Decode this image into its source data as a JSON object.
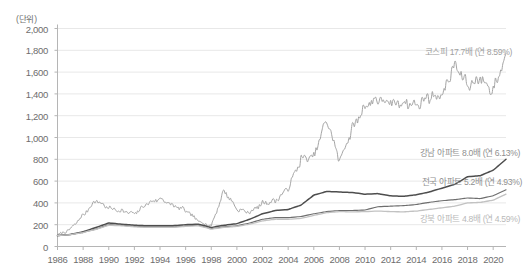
{
  "unit_label": "(단위)",
  "axis": {
    "y_ticks": [
      "2,000",
      "1,800",
      "1,600",
      "1,400",
      "1,200",
      "1,000",
      "800",
      "600",
      "400",
      "200",
      "0"
    ],
    "x_ticks": [
      "1986",
      "1988",
      "1990",
      "1992",
      "1994",
      "1996",
      "1998",
      "2000",
      "2002",
      "2004",
      "2006",
      "2008",
      "2010",
      "2012",
      "2014",
      "2016",
      "2018",
      "2020"
    ]
  },
  "annotations": {
    "kospi": "코스피 17.7배 (연 8.59%)",
    "gangnam": "강남 아파트 8.0배 (연 6.13%)",
    "nationwide": "전국 아파트 5.2배 (연 4.93%)",
    "gangbuk": "강북 아파트 4.8배 (연 4.59%)"
  },
  "colors": {
    "kospi_line": "#9a9a9a",
    "gangnam_line": "#4d4d4d",
    "nationwide_line": "#6e6e6e",
    "gangbuk_line": "#c2c2c2",
    "grid": "#e8e8e8",
    "axis": "#b5b5b5",
    "tick_text": "#6d6d6d",
    "note_text_kospi": "#a0a0a0",
    "note_text_gangnam": "#8f8f8f",
    "note_text_nationwide": "#8f8f8f",
    "note_text_gangbuk": "#b9b9b9"
  },
  "chart_data": {
    "type": "line",
    "title": "",
    "subtitle": "",
    "xlabel": "",
    "ylabel": "(단위)",
    "xlim": [
      1986,
      2021
    ],
    "ylim": [
      0,
      2000
    ],
    "grid": true,
    "legend_position": "inline-right-annotations",
    "x": [
      1986,
      1987,
      1988,
      1989,
      1990,
      1991,
      1992,
      1993,
      1994,
      1995,
      1996,
      1997,
      1998,
      1999,
      2000,
      2001,
      2002,
      2003,
      2004,
      2005,
      2006,
      2007,
      2008,
      2009,
      2010,
      2011,
      2012,
      2013,
      2014,
      2015,
      2016,
      2017,
      2018,
      2019,
      2020,
      2021
    ],
    "series": [
      {
        "name": "코스피",
        "label": "코스피 17.7배 (연 8.59%)",
        "multiple": 17.7,
        "annual_return_pct": 8.59,
        "color": "#9a9a9a",
        "values": [
          100,
          160,
          290,
          420,
          350,
          330,
          300,
          390,
          440,
          380,
          330,
          230,
          190,
          520,
          340,
          310,
          400,
          420,
          530,
          800,
          830,
          1170,
          780,
          1080,
          1300,
          1350,
          1300,
          1330,
          1300,
          1370,
          1380,
          1680,
          1480,
          1530,
          1430,
          1770
        ]
      },
      {
        "name": "강남 아파트",
        "label": "강남 아파트 8.0배 (연 6.13%)",
        "multiple": 8.0,
        "annual_return_pct": 6.13,
        "color": "#4d4d4d",
        "values": [
          100,
          110,
          135,
          175,
          215,
          205,
          195,
          190,
          190,
          190,
          200,
          205,
          175,
          195,
          210,
          250,
          300,
          330,
          340,
          380,
          470,
          505,
          500,
          495,
          480,
          485,
          465,
          460,
          475,
          500,
          535,
          570,
          640,
          650,
          700,
          800
        ]
      },
      {
        "name": "전국 아파트",
        "label": "전국 아파트 5.2배 (연 4.93%)",
        "multiple": 5.2,
        "annual_return_pct": 4.93,
        "color": "#6e6e6e",
        "values": [
          100,
          110,
          130,
          160,
          200,
          195,
          185,
          180,
          180,
          180,
          190,
          195,
          165,
          180,
          190,
          215,
          250,
          265,
          265,
          275,
          300,
          320,
          330,
          330,
          335,
          365,
          370,
          375,
          385,
          405,
          420,
          430,
          445,
          440,
          465,
          520
        ]
      },
      {
        "name": "강북 아파트",
        "label": "강북 아파트 4.8배 (연 4.59%)",
        "multiple": 4.8,
        "annual_return_pct": 4.59,
        "color": "#c2c2c2",
        "values": [
          100,
          108,
          128,
          158,
          195,
          190,
          180,
          175,
          175,
          175,
          185,
          190,
          160,
          175,
          185,
          205,
          235,
          250,
          250,
          258,
          285,
          310,
          320,
          318,
          320,
          325,
          320,
          318,
          325,
          340,
          355,
          370,
          400,
          405,
          425,
          480
        ]
      }
    ]
  }
}
